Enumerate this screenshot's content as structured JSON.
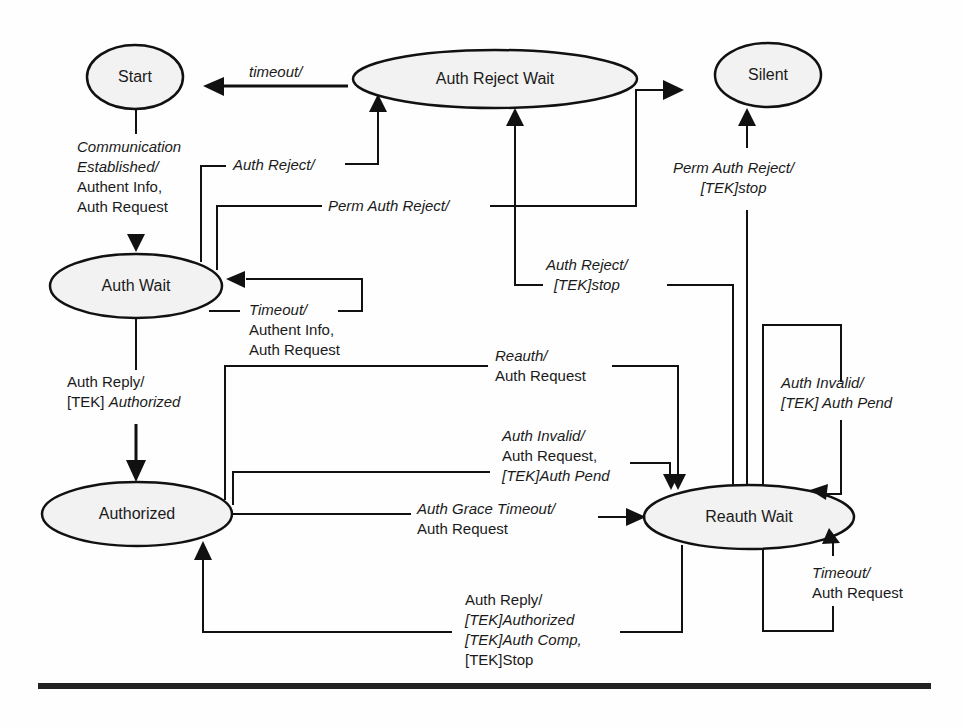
{
  "diagram": {
    "type": "state-machine",
    "states": [
      {
        "id": "start",
        "label": "Start"
      },
      {
        "id": "auth_reject_wait",
        "label": "Auth Reject Wait"
      },
      {
        "id": "silent",
        "label": "Silent"
      },
      {
        "id": "auth_wait",
        "label": "Auth Wait"
      },
      {
        "id": "authorized",
        "label": "Authorized"
      },
      {
        "id": "reauth_wait",
        "label": "Reauth Wait"
      }
    ],
    "transitions": {
      "start_to_auth_wait": {
        "event": "Communication Established/",
        "action1": "Authent Info,",
        "action2": "Auth Request",
        "event_line1": "Communication",
        "event_line2": "Established/"
      },
      "reject_wait_to_start": {
        "event": "timeout/"
      },
      "auth_wait_to_reject_wait": {
        "event": "Auth Reject/"
      },
      "auth_wait_to_silent": {
        "event": "Perm Auth Reject/"
      },
      "auth_wait_self": {
        "event": "Timeout/",
        "action1": "Authent Info,",
        "action2": "Auth Request"
      },
      "auth_wait_to_authorized": {
        "event": "Auth Reply/",
        "action_prefix": "[TEK]",
        "action": "Authorized"
      },
      "reauth_wait_to_reject_wait": {
        "event": "Auth Reject/",
        "action": "[TEK]stop"
      },
      "reauth_wait_to_silent": {
        "event": "Perm Auth Reject/",
        "action": "[TEK]stop"
      },
      "authorized_reauth": {
        "event": "Reauth/",
        "action": "Auth Request"
      },
      "authorized_auth_invalid": {
        "event": "Auth Invalid/",
        "action1": "Auth Request,",
        "action2": "[TEK]Auth Pend"
      },
      "authorized_grace_timeout": {
        "event": "Auth Grace Timeout/",
        "action": "Auth Request"
      },
      "reauth_wait_auth_invalid_self": {
        "event": "Auth Invalid/",
        "action": "[TEK] Auth Pend"
      },
      "reauth_wait_timeout_self": {
        "event": "Timeout/",
        "action": "Auth Request"
      },
      "reauth_wait_to_authorized": {
        "event": "Auth Reply/",
        "action1": "[TEK]Authorized",
        "action2": "[TEK]Auth Comp,",
        "action3": "[TEK]Stop"
      }
    }
  }
}
